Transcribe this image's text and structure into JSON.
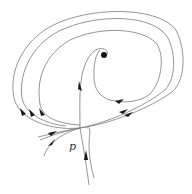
{
  "diagram": {
    "type": "phase-portrait",
    "labels": {
      "saddle_point": "p"
    },
    "colors": {
      "stroke": "#7a7a7a",
      "arrow": "#1a1a1a",
      "fixed_point": "#111111",
      "background": "#ffffff"
    },
    "elements": {
      "fixed_point": {
        "x": 104,
        "y": 55
      },
      "saddle_point": {
        "x": 80,
        "y": 128
      }
    }
  }
}
